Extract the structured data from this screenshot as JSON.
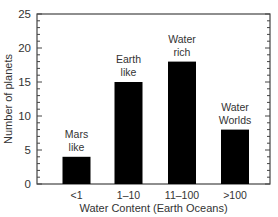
{
  "chart_data": {
    "type": "bar",
    "title": "",
    "xlabel": "Water Content (Earth Oceans)",
    "ylabel": "Number of planets",
    "categories": [
      "<1",
      "1–10",
      "11–100",
      ">100"
    ],
    "values": [
      4,
      15,
      18,
      8
    ],
    "annotations": [
      [
        "Mars",
        "like"
      ],
      [
        "Earth",
        "like"
      ],
      [
        "Water",
        "rich"
      ],
      [
        "Water",
        "Worlds"
      ]
    ],
    "ylim": [
      0,
      25
    ],
    "yticks": [
      0,
      5,
      10,
      15,
      20,
      25
    ],
    "minor_tick_step": 1,
    "bar_color": "#000000",
    "grid": false,
    "legend": null
  }
}
